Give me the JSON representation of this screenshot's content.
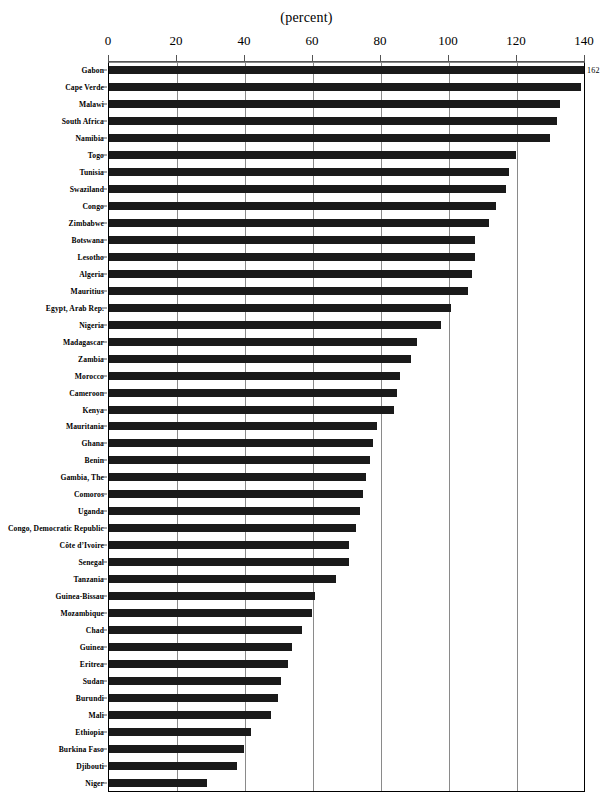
{
  "chart_data": {
    "type": "bar",
    "orientation": "horizontal",
    "title": "(percent)",
    "xlabel": "",
    "ylabel": "",
    "xlim": [
      0,
      140
    ],
    "xticks": [
      0,
      20,
      40,
      60,
      80,
      100,
      120,
      140
    ],
    "xticklabels": [
      "0",
      "20",
      "40",
      "60",
      "80",
      "100",
      "120",
      "140"
    ],
    "grid": true,
    "legend": "none",
    "annotations": [
      {
        "label": "162",
        "category": "Gabon",
        "note": "value exceeds axis maximum; bar truncated at 140"
      }
    ],
    "categories": [
      "Gabon",
      "Cape Verde",
      "Malawi",
      "South Africa",
      "Namibia",
      "Togo",
      "Tunisia",
      "Swaziland",
      "Congo",
      "Zimbabwe",
      "Botswana",
      "Lesotho",
      "Algeria",
      "Mauritius",
      "Egypt, Arab Rep.",
      "Nigeria",
      "Madagascar",
      "Zambia",
      "Morocco",
      "Cameroon",
      "Kenya",
      "Mauritania",
      "Ghana",
      "Benin",
      "Gambia, The",
      "Comoros",
      "Uganda",
      "Congo, Democratic  Republic",
      "Côte d’Ivoire",
      "Senegal",
      "Tanzania",
      "Guinea-Bissau",
      "Mozambique",
      "Chad",
      "Guinea",
      "Eritrea",
      "Sudan",
      "Burundi",
      "Mali",
      "Ethiopia",
      "Burkina Faso",
      "Djibouti",
      "Niger"
    ],
    "values": [
      162,
      139,
      133,
      132,
      130,
      120,
      118,
      117,
      114,
      112,
      108,
      108,
      107,
      106,
      101,
      98,
      91,
      89,
      86,
      85,
      84,
      79,
      78,
      77,
      76,
      75,
      74,
      73,
      71,
      71,
      67,
      61,
      60,
      57,
      54,
      53,
      51,
      50,
      48,
      42,
      40,
      38,
      29
    ],
    "bar_color": "#1a1a1a",
    "gridline_color": "#8a8a8a"
  }
}
